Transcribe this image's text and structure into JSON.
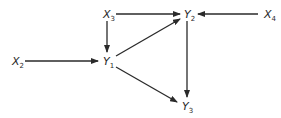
{
  "diagram": {
    "type": "directed-graph",
    "nodes": [
      {
        "id": "X3",
        "letter": "X",
        "sub": "3",
        "x": 107,
        "y": 14
      },
      {
        "id": "Y2",
        "letter": "Y",
        "sub": "2",
        "x": 188,
        "y": 14
      },
      {
        "id": "X4",
        "letter": "X",
        "sub": "4",
        "x": 268,
        "y": 14
      },
      {
        "id": "X2",
        "letter": "X",
        "sub": "2",
        "x": 16,
        "y": 61
      },
      {
        "id": "Y1",
        "letter": "Y",
        "sub": "1",
        "x": 107,
        "y": 61
      },
      {
        "id": "Y3",
        "letter": "Y",
        "sub": "3",
        "x": 186,
        "y": 106
      }
    ],
    "edges": [
      {
        "from": "X3",
        "to": "Y2",
        "x1": 116,
        "y1": 14,
        "x2": 180,
        "y2": 14
      },
      {
        "from": "X4",
        "to": "Y2",
        "x1": 258,
        "y1": 14,
        "x2": 198,
        "y2": 14
      },
      {
        "from": "X3",
        "to": "Y1",
        "x1": 107,
        "y1": 21,
        "x2": 107,
        "y2": 52
      },
      {
        "from": "X2",
        "to": "Y1",
        "x1": 25,
        "y1": 61,
        "x2": 98,
        "y2": 61
      },
      {
        "from": "Y1",
        "to": "Y2",
        "x1": 116,
        "y1": 56,
        "x2": 180,
        "y2": 19
      },
      {
        "from": "Y1",
        "to": "Y3",
        "x1": 116,
        "y1": 67,
        "x2": 177,
        "y2": 102
      },
      {
        "from": "Y2",
        "to": "Y3",
        "x1": 187,
        "y1": 21,
        "x2": 187,
        "y2": 97
      }
    ]
  }
}
